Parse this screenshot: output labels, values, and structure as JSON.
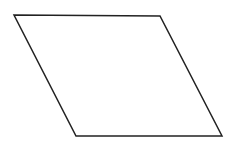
{
  "diagram": {
    "shape": "parallelogram",
    "points": "14,15 160,16 222,136 76,136",
    "stroke": "#222222",
    "fill": "none",
    "stroke_width": "1.5"
  }
}
